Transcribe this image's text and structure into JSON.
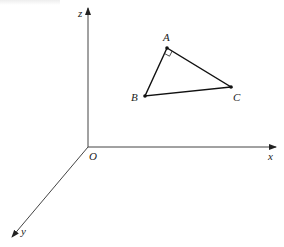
{
  "diagram": {
    "axes": {
      "origin": {
        "label": "O",
        "x": 88,
        "y": 147
      },
      "x": {
        "label": "x",
        "tip": [
          277,
          147
        ]
      },
      "y": {
        "label": "y",
        "tip": [
          11,
          238
        ]
      },
      "z": {
        "label": "z",
        "tip": [
          88,
          7
        ]
      }
    },
    "points": {
      "A": {
        "label": "A",
        "x": 167,
        "y": 48
      },
      "B": {
        "label": "B",
        "x": 145,
        "y": 96
      },
      "C": {
        "label": "C",
        "x": 231,
        "y": 87
      }
    },
    "right_angle_at": "A",
    "colors": {
      "axis": "#444444",
      "edge": "#111111",
      "background": "#ffffff"
    }
  }
}
